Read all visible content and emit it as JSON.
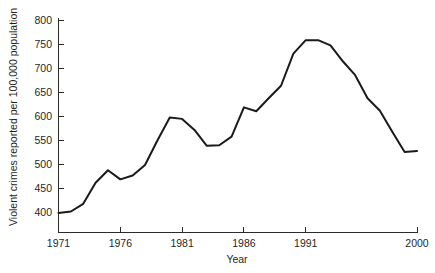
{
  "chart_data": {
    "type": "line",
    "title": "",
    "subtitle": "",
    "xlabel": "Year",
    "ylabel": "Violent crimes reported per 100,000 population",
    "xlim": [
      1971,
      2000
    ],
    "ylim": [
      375,
      800
    ],
    "grid": false,
    "legend": null,
    "legend_position": "none",
    "x_tick_labels": [
      "1971",
      "1976",
      "1981",
      "1986",
      "1991",
      "2000"
    ],
    "x_tick_values": [
      1971,
      1976,
      1981,
      1986,
      1991,
      2000
    ],
    "y_tick_labels": [
      "400",
      "450",
      "500",
      "550",
      "600",
      "650",
      "700",
      "750",
      "800"
    ],
    "y_tick_values": [
      400,
      450,
      500,
      550,
      600,
      650,
      700,
      750,
      800
    ],
    "series": [
      {
        "name": "Violent crime rate",
        "color": "#1a1a1a",
        "x": [
          1971,
          1972,
          1973,
          1974,
          1975,
          1976,
          1977,
          1978,
          1979,
          1980,
          1981,
          1982,
          1983,
          1984,
          1985,
          1986,
          1987,
          1988,
          1989,
          1990,
          1991,
          1992,
          1993,
          1994,
          1995,
          1996,
          1997,
          1998,
          1999,
          2000
        ],
        "values": [
          398,
          401,
          417,
          461,
          487,
          468,
          476,
          498,
          549,
          597,
          594,
          571,
          538,
          539,
          557,
          618,
          610,
          637,
          663,
          730,
          758,
          758,
          747,
          714,
          685,
          637,
          611,
          567,
          525,
          527
        ]
      }
    ]
  },
  "axis": {
    "x_label": "Year",
    "y_label": "Violent crimes reported per 100,000 population"
  }
}
